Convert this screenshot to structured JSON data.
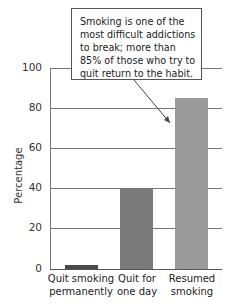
{
  "chart_data": {
    "type": "bar",
    "title": "",
    "xlabel": "",
    "ylabel": "Percentage",
    "ylim": [
      0,
      100
    ],
    "yticks": [
      0,
      20,
      40,
      60,
      80,
      100
    ],
    "grid": true,
    "categories": [
      "Quit smoking permanently",
      "Quit for one day",
      "Resumed smoking"
    ],
    "category_lines": [
      [
        "Quit smoking",
        "permanently"
      ],
      [
        "Quit for",
        "one day"
      ],
      [
        "Resumed",
        "smoking"
      ]
    ],
    "values": [
      2,
      40,
      85
    ],
    "colors": [
      "#4a4a4a",
      "#7a7a7a",
      "#9a9a9a"
    ],
    "annotation": "Smoking is one of the most difficult addictions to break; more than 85% of those who try to quit return to the habit."
  },
  "ticks": [
    "100",
    "80",
    "60",
    "40",
    "20",
    "0"
  ]
}
